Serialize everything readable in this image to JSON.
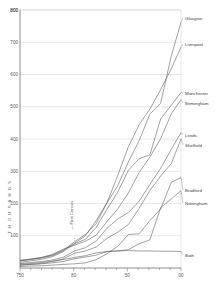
{
  "chart_data": {
    "type": "line",
    "title": "",
    "xlabel": "",
    "ylabel": "THOUSANDS",
    "xlim": [
      1750,
      1900
    ],
    "ylim": [
      0,
      800
    ],
    "grid": true,
    "legend_position": "right-inline-labels",
    "x_ticks": [
      1750,
      1800,
      1850,
      1900
    ],
    "x_tick_labels": [
      "750",
      "80",
      "50",
      "00"
    ],
    "x_minor_tick_step": 10,
    "y_ticks": [
      100,
      200,
      300,
      400,
      500,
      600,
      700,
      800
    ],
    "y_tick_labels": [
      "100",
      "200",
      "300",
      "400",
      "500",
      "600",
      "700",
      "800"
    ],
    "annotations": [
      {
        "text": "First Census",
        "x": 1801,
        "y": 100,
        "orientation": "vertical"
      }
    ],
    "series": [
      {
        "name": "Glasgow",
        "label": "Glasgow",
        "x": [
          1750,
          1760,
          1770,
          1780,
          1790,
          1801,
          1811,
          1821,
          1831,
          1841,
          1851,
          1861,
          1871,
          1881,
          1891,
          1900
        ],
        "values": [
          23,
          27,
          32,
          40,
          55,
          77,
          100,
          147,
          202,
          255,
          329,
          395,
          477,
          511,
          658,
          762
        ]
      },
      {
        "name": "Liverpool",
        "label": "Liverpool",
        "x": [
          1750,
          1760,
          1770,
          1780,
          1790,
          1801,
          1811,
          1821,
          1831,
          1841,
          1851,
          1861,
          1871,
          1881,
          1891,
          1900
        ],
        "values": [
          22,
          26,
          31,
          38,
          53,
          82,
          104,
          138,
          202,
          286,
          376,
          444,
          493,
          553,
          618,
          685
        ]
      },
      {
        "name": "Manchester",
        "label": "Manchester",
        "x": [
          1750,
          1760,
          1770,
          1780,
          1790,
          1801,
          1811,
          1821,
          1831,
          1841,
          1851,
          1861,
          1871,
          1881,
          1891,
          1900
        ],
        "values": [
          18,
          22,
          27,
          35,
          50,
          75,
          89,
          126,
          182,
          235,
          303,
          339,
          351,
          462,
          505,
          544
        ]
      },
      {
        "name": "Birmingham",
        "label": "Birmingham",
        "x": [
          1750,
          1760,
          1770,
          1780,
          1790,
          1801,
          1811,
          1821,
          1831,
          1841,
          1851,
          1861,
          1871,
          1881,
          1891,
          1900
        ],
        "values": [
          24,
          28,
          33,
          42,
          58,
          71,
          83,
          102,
          144,
          183,
          233,
          296,
          344,
          401,
          478,
          522
        ]
      },
      {
        "name": "Leeds",
        "label": "Leeds",
        "x": [
          1750,
          1760,
          1770,
          1780,
          1790,
          1801,
          1811,
          1821,
          1831,
          1841,
          1851,
          1861,
          1871,
          1881,
          1891,
          1900
        ],
        "values": [
          14,
          17,
          20,
          25,
          33,
          53,
          63,
          84,
          123,
          152,
          172,
          207,
          259,
          309,
          368,
          420
        ]
      },
      {
        "name": "Sheffield",
        "label": "Sheffield",
        "x": [
          1750,
          1760,
          1770,
          1780,
          1790,
          1801,
          1811,
          1821,
          1831,
          1841,
          1851,
          1861,
          1871,
          1881,
          1891,
          1900
        ],
        "values": [
          12,
          14,
          17,
          21,
          28,
          46,
          53,
          65,
          92,
          111,
          135,
          185,
          240,
          285,
          324,
          400
        ]
      },
      {
        "name": "Bradford",
        "label": "Bradford",
        "x": [
          1750,
          1760,
          1770,
          1780,
          1790,
          1801,
          1811,
          1821,
          1831,
          1841,
          1851,
          1861,
          1871,
          1881,
          1891,
          1900
        ],
        "values": [
          5,
          6,
          7,
          9,
          11,
          13,
          16,
          26,
          44,
          67,
          104,
          106,
          147,
          183,
          266,
          280
        ]
      },
      {
        "name": "Nottingham",
        "label": "Nottingham",
        "x": [
          1750,
          1760,
          1770,
          1780,
          1790,
          1801,
          1811,
          1821,
          1831,
          1841,
          1851,
          1861,
          1871,
          1881,
          1891,
          1900
        ],
        "values": [
          10,
          11,
          13,
          16,
          20,
          29,
          34,
          40,
          51,
          53,
          57,
          75,
          87,
          187,
          214,
          240
        ]
      },
      {
        "name": "Bath",
        "label": "Bath",
        "x": [
          1750,
          1760,
          1770,
          1780,
          1790,
          1801,
          1811,
          1821,
          1831,
          1841,
          1851,
          1861,
          1871,
          1881,
          1891,
          1900
        ],
        "values": [
          8,
          11,
          14,
          20,
          26,
          33,
          38,
          47,
          51,
          53,
          54,
          53,
          53,
          52,
          52,
          51
        ]
      }
    ]
  },
  "axes": {
    "y_title": "T H O U S A N D S"
  }
}
